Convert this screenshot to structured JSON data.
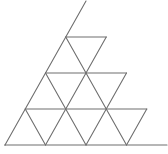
{
  "diagram": {
    "type": "subdivided-triangle",
    "rows": 4,
    "apex": [
      86,
      1
    ],
    "base_left": [
      5,
      145
    ],
    "base_right": [
      167,
      145
    ],
    "line_color": "#6e6e6e",
    "background": "#ffffff"
  }
}
